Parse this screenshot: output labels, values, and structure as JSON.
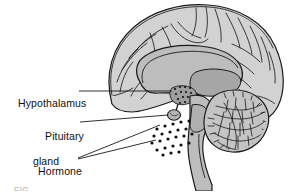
{
  "figure": {
    "background_color": "#ffffff",
    "ink_color": "#1a1a1a",
    "fill_light": "#d2d2d2",
    "fill_mid": "#bdbdbd",
    "fill_dark": "#9e9e9e",
    "footer_partial_text": "FIG."
  },
  "labels": {
    "hypothalamus": {
      "text": "Hypothalamus",
      "leader": "horizontal-line-to-hypothalamus"
    },
    "pituitary": {
      "line1": "Pituitary",
      "line2": "gland",
      "leader": "line-to-pituitary-gland"
    },
    "hormone": {
      "line1": "Hormone",
      "line2": "molecules",
      "leader": "two-lines-to-hormone-dots"
    }
  },
  "structures": [
    {
      "name": "cerebral-cortex",
      "fill": "#d2d2d2"
    },
    {
      "name": "corpus-callosum",
      "fill": "#bdbdbd"
    },
    {
      "name": "thalamus",
      "fill": "#a8a8a8"
    },
    {
      "name": "hypothalamus",
      "fill": "#9e9e9e"
    },
    {
      "name": "pituitary-gland",
      "fill": "#b5b5b5"
    },
    {
      "name": "brainstem",
      "fill": "#bdbdbd"
    },
    {
      "name": "cerebellum",
      "fill": "#c4c4c4"
    }
  ],
  "hormone_dots": {
    "count": 24,
    "color": "#111111",
    "radius": 1.6,
    "points": [
      [
        157,
        129
      ],
      [
        165,
        126
      ],
      [
        173,
        124
      ],
      [
        181,
        122
      ],
      [
        189,
        121
      ],
      [
        154,
        136
      ],
      [
        162,
        134
      ],
      [
        170,
        132
      ],
      [
        178,
        130
      ],
      [
        186,
        129
      ],
      [
        152,
        143
      ],
      [
        160,
        141
      ],
      [
        168,
        139
      ],
      [
        176,
        137
      ],
      [
        184,
        136
      ],
      [
        192,
        134
      ],
      [
        157,
        150
      ],
      [
        165,
        148
      ],
      [
        173,
        146
      ],
      [
        181,
        145
      ],
      [
        189,
        143
      ],
      [
        163,
        155
      ],
      [
        171,
        153
      ],
      [
        179,
        152
      ]
    ]
  }
}
